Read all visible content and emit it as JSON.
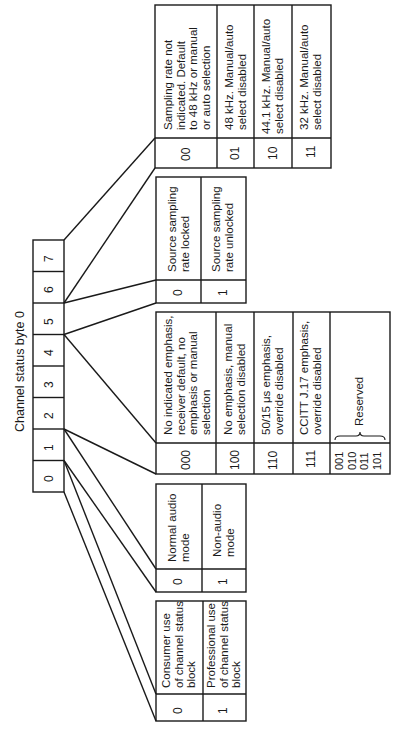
{
  "title": "Channel status byte 0",
  "byte_bits": [
    "7",
    "6",
    "5",
    "4",
    "3",
    "2",
    "1",
    "0"
  ],
  "tables": {
    "sampling_rate": {
      "rows": [
        {
          "code": "00",
          "desc_lines": [
            "Sampling rate not",
            "indicated. Default",
            "to 48 kHz or manual",
            "or auto selection"
          ]
        },
        {
          "code": "01",
          "desc_lines": [
            "48 kHz. Manual/auto",
            "select disabled"
          ]
        },
        {
          "code": "10",
          "desc_lines": [
            "44.1 kHz. Manual/auto",
            "select disabled"
          ]
        },
        {
          "code": "11",
          "desc_lines": [
            "32 kHz. Manual/auto",
            "select disabled"
          ]
        }
      ]
    },
    "source_lock": {
      "rows": [
        {
          "code": "0",
          "desc_lines": [
            "Source sampling",
            "rate locked"
          ]
        },
        {
          "code": "1",
          "desc_lines": [
            "Source sampling",
            "rate unlocked"
          ]
        }
      ]
    },
    "emphasis": {
      "rows": [
        {
          "code": "000",
          "desc_lines": [
            "No indicated emphasis,",
            "receiver default, no",
            "emphasis or manual",
            "selection"
          ]
        },
        {
          "code": "100",
          "desc_lines": [
            "No emphasis, manual",
            "selection disabled"
          ]
        },
        {
          "code": "110",
          "desc_lines": [
            "50/15 μs emphasis,",
            "override disabled"
          ]
        },
        {
          "code": "111",
          "desc_lines": [
            "CCITT J.17 emphasis,",
            "override disabled"
          ]
        },
        {
          "code_lines": [
            "001",
            "010",
            "011",
            "101"
          ],
          "desc_lines": [
            "Reserved"
          ]
        }
      ]
    },
    "audio_mode": {
      "rows": [
        {
          "code": "0",
          "desc_lines": [
            "Normal audio",
            "mode"
          ]
        },
        {
          "code": "1",
          "desc_lines": [
            "Non-audio",
            "mode"
          ]
        }
      ]
    },
    "use": {
      "rows": [
        {
          "code": "0",
          "desc_lines": [
            "Consumer use",
            "of channel status",
            "block"
          ]
        },
        {
          "code": "1",
          "desc_lines": [
            "Professional use",
            "of channel status",
            "block"
          ]
        }
      ]
    }
  }
}
